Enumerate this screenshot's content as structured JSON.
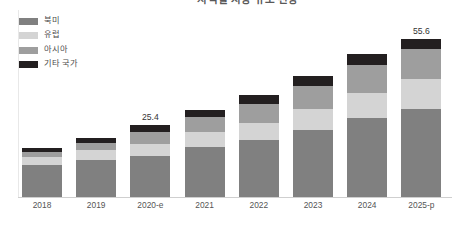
{
  "chart_data": {
    "type": "bar",
    "stacked": true,
    "title": "지역별 시장 규모 전망",
    "xlabel": "",
    "ylabel": "",
    "grid": false,
    "legend_position": "top-left",
    "categories": [
      "2018",
      "2019",
      "2020-e",
      "2021",
      "2022",
      "2023",
      "2024",
      "2025-p"
    ],
    "series": [
      {
        "name": "북미",
        "color": "#808080",
        "values": [
          11.2,
          13.0,
          14.6,
          17.6,
          20.0,
          23.6,
          27.8,
          31.0
        ]
      },
      {
        "name": "유럽",
        "color": "#d4d4d4",
        "values": [
          2.8,
          3.6,
          4.2,
          5.2,
          6.2,
          7.4,
          9.0,
          10.6
        ]
      },
      {
        "name": "아시아",
        "color": "#9e9e9e",
        "values": [
          2.0,
          2.6,
          4.2,
          5.4,
          6.6,
          8.2,
          9.8,
          10.4
        ]
      },
      {
        "name": "기타 국가",
        "color": "#231f20",
        "values": [
          1.4,
          1.6,
          2.4,
          2.6,
          3.0,
          3.4,
          3.8,
          3.6
        ]
      }
    ],
    "totals": [
      17.4,
      20.8,
      25.4,
      30.8,
      35.8,
      42.6,
      50.4,
      55.6
    ],
    "value_labels": {
      "2020-e": "25.4",
      "2025-p": "55.6"
    },
    "ylim": [
      0,
      62
    ]
  },
  "legend": {
    "items": [
      {
        "label": "북미",
        "color": "#808080"
      },
      {
        "label": "유럽",
        "color": "#d4d4d4"
      },
      {
        "label": "아시아",
        "color": "#9e9e9e"
      },
      {
        "label": "기타 국가",
        "color": "#231f20"
      }
    ]
  }
}
